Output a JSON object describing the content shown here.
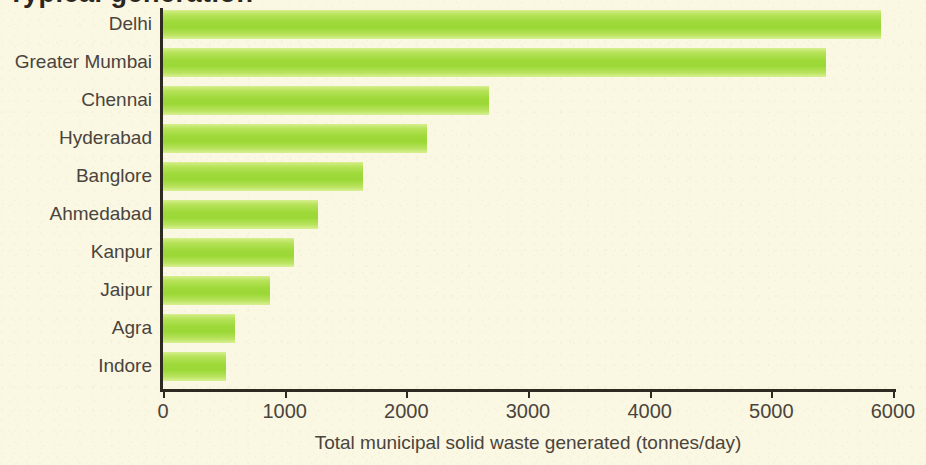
{
  "chart_data": {
    "type": "bar",
    "orientation": "horizontal",
    "title": "",
    "xlabel": "Total municipal solid waste generated (tonnes/day)",
    "ylabel": "",
    "categories": [
      "Delhi",
      "Greater Mumbai",
      "Chennai",
      "Hyderabad",
      "Banglore",
      "Ahmedabad",
      "Kanpur",
      "Jaipur",
      "Agra",
      "Indore"
    ],
    "values": [
      5900,
      5450,
      2680,
      2170,
      1640,
      1270,
      1080,
      880,
      590,
      520
    ],
    "xlim": [
      0,
      6000
    ],
    "xticks": [
      0,
      1000,
      2000,
      3000,
      4000,
      5000,
      6000
    ],
    "xtick_labels": [
      "0",
      "1000",
      "2000",
      "3000",
      "4000",
      "5000",
      "6000"
    ],
    "grid": false,
    "legend": null,
    "bar_color": "#9ed93a",
    "bar_color_light": "#d7ef8e",
    "background_color": "#faf7e3",
    "axis_color": "#2e2a22",
    "text_color": "#4a443c"
  },
  "figure": {
    "cropped_title_remnant": "Typical generation"
  }
}
